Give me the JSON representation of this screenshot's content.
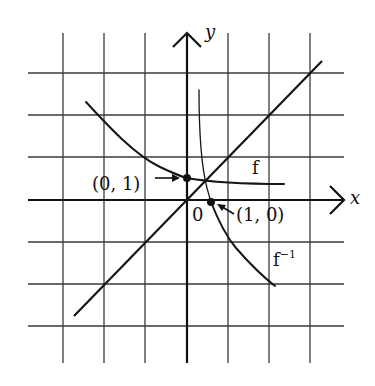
{
  "diagram": {
    "title": "",
    "axes": {
      "x_label": "x",
      "y_label": "y",
      "origin_label": "0"
    },
    "curves": [
      {
        "name": "f",
        "label": "f",
        "description": "decreasing exponential passing through (0, 1)"
      },
      {
        "name": "f_inverse",
        "label": "f",
        "label_superscript": "−1",
        "description": "inverse function passing through (1, 0)"
      },
      {
        "name": "identity",
        "label": "",
        "description": "line y = x"
      }
    ],
    "points": [
      {
        "label": "(0, 1)",
        "x": 0,
        "y": 1
      },
      {
        "label": "(1, 0)",
        "x": 1,
        "y": 0
      }
    ],
    "grid": {
      "columns": 7,
      "rows": 7,
      "visible": true
    },
    "colors": {
      "ink": "#111111",
      "grid": "#3a3a3a",
      "background": "#ffffff"
    }
  }
}
